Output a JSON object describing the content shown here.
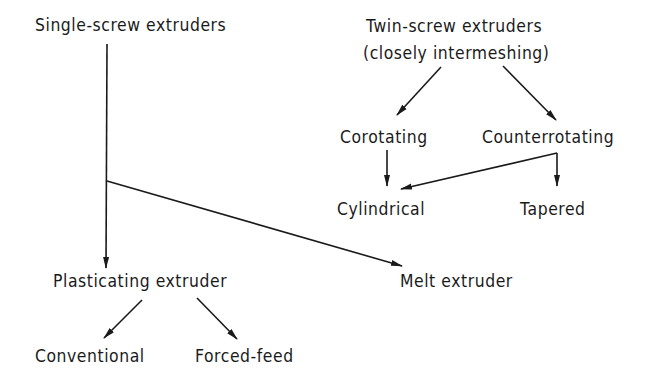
{
  "diagram": {
    "type": "tree",
    "nodes": {
      "single_screw": "Single-screw extruders",
      "twin_screw_line1": "Twin-screw extruders",
      "twin_screw_line2": "(closely intermeshing)",
      "corotating": "Corotating",
      "counterrotating": "Counterrotating",
      "cylindrical": "Cylindrical",
      "tapered": "Tapered",
      "plasticating": "Plasticating extruder",
      "melt": "Melt extruder",
      "conventional": "Conventional",
      "forced_feed": "Forced-feed"
    },
    "edges": [
      {
        "from": "Single-screw extruders",
        "to": "Plasticating extruder"
      },
      {
        "from": "Single-screw extruders",
        "to": "Melt extruder"
      },
      {
        "from": "Plasticating extruder",
        "to": "Conventional"
      },
      {
        "from": "Plasticating extruder",
        "to": "Forced-feed"
      },
      {
        "from": "Twin-screw extruders (closely intermeshing)",
        "to": "Corotating"
      },
      {
        "from": "Twin-screw extruders (closely intermeshing)",
        "to": "Counterrotating"
      },
      {
        "from": "Corotating",
        "to": "Cylindrical"
      },
      {
        "from": "Counterrotating",
        "to": "Cylindrical"
      },
      {
        "from": "Counterrotating",
        "to": "Tapered"
      }
    ],
    "colors": {
      "line": "#1a1a1a",
      "background": "#ffffff"
    }
  }
}
